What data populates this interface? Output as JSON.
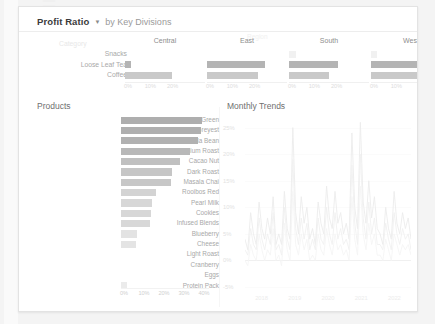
{
  "watermark": {
    "text": "PERFORMANCE ASSESSMENT"
  },
  "header": {
    "title": "Profit Ratio",
    "caret_icon": "caret-down-icon",
    "subtitle": "by Key Divisions"
  },
  "top_panel": {
    "region_header": "Region",
    "category_header": "Category"
  },
  "products_panel": {
    "title": "Products"
  },
  "trends_panel": {
    "title": "Monthly Trends"
  },
  "chart_data": [
    {
      "type": "bar",
      "title": "Profit Ratio by Key Divisions",
      "orientation": "horizontal",
      "small_multiples_by": "Region",
      "categories": [
        "Snacks",
        "Loose Leaf Tea",
        "Coffee"
      ],
      "xlabel": "",
      "ylabel": "Category",
      "xlim": [
        0,
        35
      ],
      "tick_labels": [
        "0%",
        "10%",
        "20%",
        "30%"
      ],
      "grid": false,
      "panels": [
        {
          "name": "Central",
          "values": [
            0,
            2.5,
            21
          ],
          "ticks": [
            "0%",
            "10%",
            "20%"
          ]
        },
        {
          "name": "East",
          "values": [
            0,
            26,
            23
          ],
          "ticks": [
            "0%",
            "10%",
            "20%"
          ]
        },
        {
          "name": "South",
          "values": [
            3,
            22,
            18
          ],
          "ticks": [
            "0%",
            "10%",
            "20%"
          ]
        },
        {
          "name": "West",
          "values": [
            2.5,
            32,
            21
          ],
          "ticks": [
            "0%",
            "10%",
            "30%"
          ]
        }
      ]
    },
    {
      "type": "bar",
      "title": "Products",
      "orientation": "horizontal",
      "xlabel": "",
      "ylabel": "",
      "xlim": [
        0,
        44
      ],
      "tick_labels": [
        "0%",
        "10%",
        "20%",
        "30%",
        "40%"
      ],
      "grid": false,
      "categories": [
        "Spring Green",
        "Earl Greyest",
        "Vanilla Bean",
        "Medium Roast",
        "Cacao Nut",
        "Dark Roast",
        "Masala Chai",
        "Rooibos Red",
        "Pearl Milk",
        "Cookies",
        "Infused Blends",
        "Blueberry",
        "Cheese",
        "Light Roast",
        "Cranberry",
        "Eggs",
        "Protein Pack"
      ],
      "values": [
        40.5,
        40.0,
        38.5,
        34.5,
        29.5,
        25.5,
        25.0,
        17.5,
        15.5,
        15.0,
        14.5,
        8.0,
        7.5,
        0,
        0,
        0,
        3.0
      ]
    },
    {
      "type": "line",
      "title": "Monthly Trends",
      "xlabel": "",
      "ylabel": "",
      "ylim": [
        -5,
        27
      ],
      "ytick_labels": [
        "25%",
        "20%",
        "15%",
        "10%",
        "5%",
        "0%",
        "-5%"
      ],
      "ytick_values": [
        25,
        20,
        15,
        10,
        5,
        0,
        -5
      ],
      "xtick_labels": [
        "2018",
        "2019",
        "2020",
        "2021",
        "2022"
      ],
      "grid": true,
      "legend": "none",
      "series": [
        {
          "name": "Series A",
          "values": [
            4,
            2,
            9,
            5,
            3,
            11,
            6,
            4,
            8,
            5,
            12,
            3,
            5,
            3,
            13,
            6,
            4,
            25,
            9,
            5,
            12,
            7,
            10,
            4,
            6,
            3,
            11,
            7,
            5,
            14,
            8,
            6,
            13,
            7,
            9,
            5,
            7,
            4,
            24,
            10,
            6,
            26,
            11,
            7,
            15,
            8,
            12,
            6,
            5,
            3,
            10,
            6,
            4,
            13,
            7,
            5,
            9,
            6,
            8,
            4
          ]
        },
        {
          "name": "Series B",
          "values": [
            2,
            1,
            6,
            3,
            2,
            8,
            4,
            2,
            5,
            3,
            9,
            2,
            3,
            1,
            10,
            4,
            2,
            19,
            6,
            3,
            8,
            4,
            7,
            2,
            4,
            2,
            8,
            4,
            3,
            10,
            5,
            3,
            9,
            4,
            6,
            3,
            4,
            2,
            18,
            7,
            3,
            20,
            8,
            4,
            11,
            5,
            8,
            3,
            3,
            2,
            7,
            4,
            2,
            9,
            5,
            3,
            6,
            4,
            5,
            2
          ]
        },
        {
          "name": "Series C",
          "values": [
            0,
            -1,
            3,
            1,
            0,
            5,
            2,
            0,
            2,
            1,
            6,
            0,
            1,
            -1,
            7,
            2,
            0,
            13,
            3,
            1,
            5,
            2,
            4,
            0,
            1,
            0,
            5,
            2,
            1,
            6,
            3,
            1,
            5,
            2,
            3,
            1,
            2,
            0,
            12,
            4,
            1,
            14,
            5,
            2,
            7,
            3,
            5,
            1,
            1,
            0,
            4,
            2,
            0,
            5,
            3,
            1,
            3,
            2,
            3,
            1
          ]
        }
      ]
    }
  ]
}
